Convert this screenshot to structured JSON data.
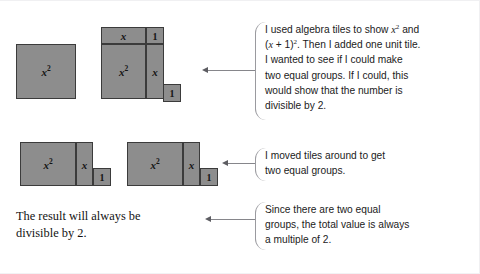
{
  "figure": {
    "tile_fill_color": "#8d8d8d",
    "tile_border_color": "#3b3b3b",
    "leader_color": "#86868b",
    "background_color": "#ffffff"
  },
  "labels": {
    "x_squared": "x",
    "x_squared_exp": "2",
    "x": "x",
    "one": "1"
  },
  "diagrams": {
    "row1": {
      "name": "initial-tiles",
      "group_a": {
        "name": "x-squared-square",
        "tiles": [
          {
            "label": "x²",
            "kind": "x-squared"
          }
        ]
      },
      "group_b": {
        "name": "x-plus-one-squared-square",
        "tiles": [
          {
            "label": "x",
            "kind": "x-top"
          },
          {
            "label": "1",
            "kind": "unit-corner"
          },
          {
            "label": "x²",
            "kind": "x-squared"
          },
          {
            "label": "x",
            "kind": "x-right"
          }
        ]
      },
      "group_c": {
        "name": "extra-unit-tile",
        "tiles": [
          {
            "label": "1",
            "kind": "unit"
          }
        ]
      }
    },
    "row2": {
      "name": "rearranged-equal-groups",
      "group_a": {
        "name": "equal-group-1",
        "tiles": [
          {
            "label": "x²",
            "kind": "x-squared"
          },
          {
            "label": "x",
            "kind": "x-right"
          },
          {
            "label": "1",
            "kind": "unit"
          }
        ]
      },
      "group_b": {
        "name": "equal-group-2",
        "tiles": [
          {
            "label": "x²",
            "kind": "x-squared"
          },
          {
            "label": "x",
            "kind": "x-right"
          },
          {
            "label": "1",
            "kind": "unit"
          }
        ]
      }
    }
  },
  "callouts": [
    {
      "id": "callout-1",
      "lines": [
        "I used algebra tiles to show x² and",
        "(x + 1)². Then I added one unit tile.",
        "I wanted to see if I could make",
        "two equal groups. If I could, this",
        "would show that the number is",
        "divisible by 2."
      ]
    },
    {
      "id": "callout-2",
      "lines": [
        "I moved tiles around to get",
        "two equal groups."
      ]
    },
    {
      "id": "callout-3",
      "lines": [
        "Since there are two equal",
        "groups, the total value is always",
        "a multiple of 2."
      ]
    }
  ],
  "conclusion": {
    "name": "conclusion-text",
    "lines": [
      "The result will always be",
      "divisible by 2."
    ]
  }
}
